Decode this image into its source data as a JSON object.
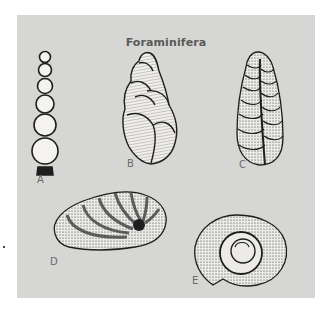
{
  "figure": {
    "title": "Foraminifera",
    "specimens": [
      {
        "label": "A",
        "shape": "uniserial chain of spherical chambers"
      },
      {
        "label": "B",
        "shape": "high-spired trochoid (bulimine) test"
      },
      {
        "label": "C",
        "shape": "biserial elongate conical test"
      },
      {
        "label": "D",
        "shape": "ovoid coiled test with curved chamber sutures"
      },
      {
        "label": "E",
        "shape": "planispiral coiled test"
      }
    ]
  },
  "colors": {
    "background": "#ffffff",
    "panel": "#d6d6d4",
    "ink": "#1e1e1e",
    "title": "#5a5a5a"
  }
}
